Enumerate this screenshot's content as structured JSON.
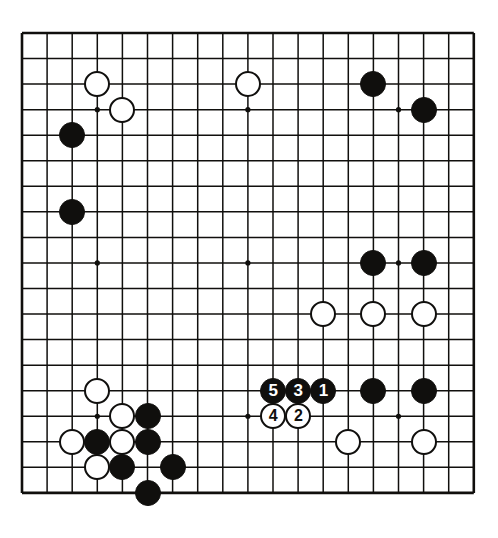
{
  "figure": {
    "kind": "go-board-diagram",
    "board_size": 19,
    "background_color": "#ffffff",
    "line_color": "#100f0d",
    "black_color": "#100f0d",
    "white_color": "#ffffff"
  },
  "board_geometry": {
    "origin_x": 22,
    "origin_y": 33,
    "cell_w": 25.1,
    "cell_h": 25.55,
    "stone_diameter": 26,
    "edge_line_width": 2.6,
    "inner_line_width": 1.5,
    "star_point_radius": 2.6,
    "star_points": [
      [
        3,
        3
      ],
      [
        9,
        3
      ],
      [
        15,
        3
      ],
      [
        3,
        9
      ],
      [
        9,
        9
      ],
      [
        15,
        9
      ],
      [
        3,
        15
      ],
      [
        9,
        15
      ],
      [
        15,
        15
      ]
    ]
  },
  "chart_data": {
    "type": "table",
    "xlabel": "column (0 = left edge)",
    "ylabel": "row (0 = top edge)",
    "columns": [
      "color",
      "col",
      "row",
      "label"
    ],
    "stones": [
      {
        "color": "white",
        "col": 3,
        "row": 2,
        "label": ""
      },
      {
        "color": "white",
        "col": 4,
        "row": 3,
        "label": ""
      },
      {
        "color": "black",
        "col": 2,
        "row": 4,
        "label": ""
      },
      {
        "color": "black",
        "col": 2,
        "row": 7,
        "label": ""
      },
      {
        "color": "white",
        "col": 9,
        "row": 2,
        "label": ""
      },
      {
        "color": "black",
        "col": 14,
        "row": 2,
        "label": ""
      },
      {
        "color": "black",
        "col": 16,
        "row": 3,
        "label": ""
      },
      {
        "color": "black",
        "col": 14,
        "row": 9,
        "label": ""
      },
      {
        "color": "black",
        "col": 16,
        "row": 9,
        "label": ""
      },
      {
        "color": "white",
        "col": 12,
        "row": 11,
        "label": ""
      },
      {
        "color": "white",
        "col": 14,
        "row": 11,
        "label": ""
      },
      {
        "color": "white",
        "col": 16,
        "row": 11,
        "label": ""
      },
      {
        "color": "white",
        "col": 3,
        "row": 14,
        "label": ""
      },
      {
        "color": "white",
        "col": 4,
        "row": 15,
        "label": ""
      },
      {
        "color": "black",
        "col": 5,
        "row": 15,
        "label": ""
      },
      {
        "color": "white",
        "col": 2,
        "row": 16,
        "label": ""
      },
      {
        "color": "black",
        "col": 3,
        "row": 16,
        "label": ""
      },
      {
        "color": "white",
        "col": 4,
        "row": 16,
        "label": ""
      },
      {
        "color": "black",
        "col": 5,
        "row": 16,
        "label": ""
      },
      {
        "color": "white",
        "col": 3,
        "row": 17,
        "label": ""
      },
      {
        "color": "black",
        "col": 4,
        "row": 17,
        "label": ""
      },
      {
        "color": "black",
        "col": 6,
        "row": 17,
        "label": ""
      },
      {
        "color": "black",
        "col": 5,
        "row": 18,
        "label": ""
      },
      {
        "color": "black",
        "col": 14,
        "row": 14,
        "label": ""
      },
      {
        "color": "black",
        "col": 16,
        "row": 14,
        "label": ""
      },
      {
        "color": "white",
        "col": 13,
        "row": 16,
        "label": ""
      },
      {
        "color": "white",
        "col": 16,
        "row": 16,
        "label": ""
      },
      {
        "color": "black",
        "col": 12,
        "row": 14,
        "label": "1"
      },
      {
        "color": "white",
        "col": 11,
        "row": 15,
        "label": "2"
      },
      {
        "color": "black",
        "col": 11,
        "row": 14,
        "label": "3"
      },
      {
        "color": "white",
        "col": 10,
        "row": 15,
        "label": "4"
      },
      {
        "color": "black",
        "col": 10,
        "row": 14,
        "label": "5"
      }
    ],
    "move_sequence": [
      {
        "move": 1,
        "color": "black",
        "col": 12,
        "row": 14
      },
      {
        "move": 2,
        "color": "white",
        "col": 11,
        "row": 15
      },
      {
        "move": 3,
        "color": "black",
        "col": 11,
        "row": 14
      },
      {
        "move": 4,
        "color": "white",
        "col": 10,
        "row": 15
      },
      {
        "move": 5,
        "color": "black",
        "col": 10,
        "row": 14
      }
    ]
  }
}
